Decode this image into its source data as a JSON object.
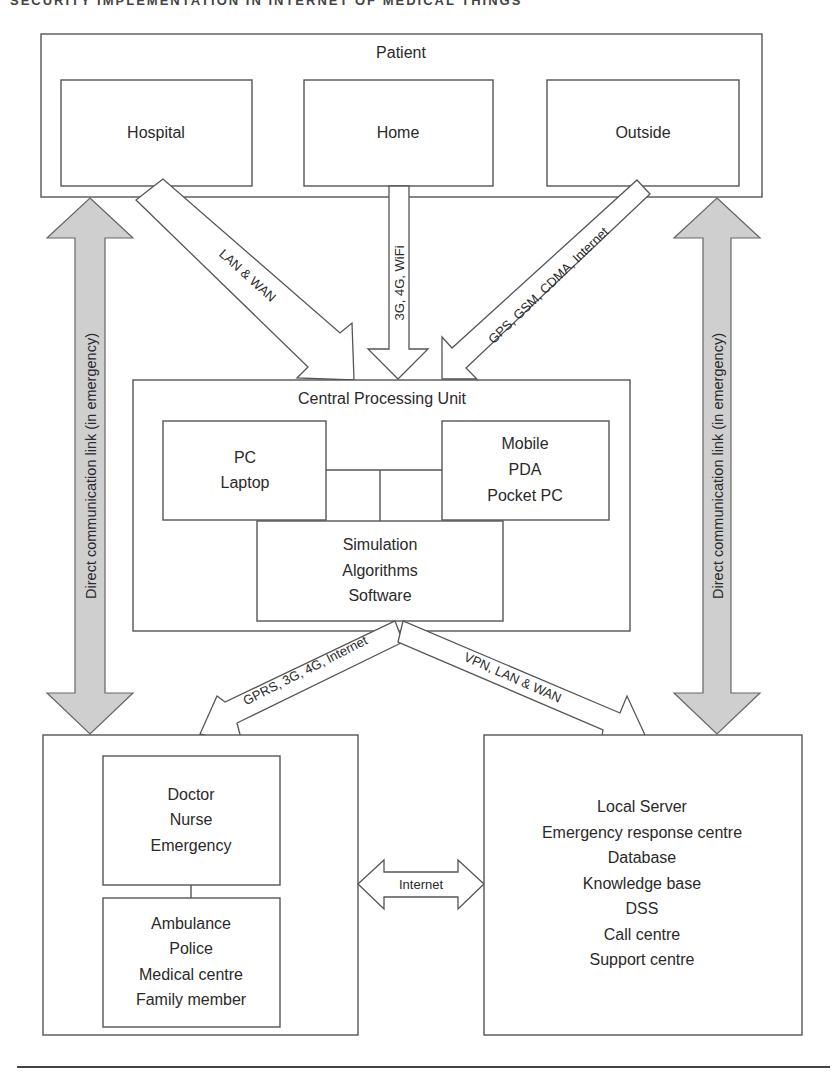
{
  "page": {
    "running_head": "SECURITY IMPLEMENTATION IN INTERNET OF MEDICAL THINGS",
    "caption": ""
  },
  "diagram": {
    "patient": {
      "title": "Patient",
      "locations": [
        "Hospital",
        "Home",
        "Outside"
      ]
    },
    "uplinks": {
      "hospital": "LAN & WAN",
      "home": "3G, 4G, WiFi",
      "outside": "GPS, GSM, CDMA, Internet"
    },
    "cpu": {
      "title": "Central Processing Unit",
      "left_box": [
        "PC",
        "Laptop"
      ],
      "right_box": [
        "Mobile",
        "PDA",
        "Pocket PC"
      ],
      "bottom_box": [
        "Simulation",
        "Algorithms",
        "Software"
      ]
    },
    "downlinks": {
      "left": "GPRS, 3G, 4G, Internet",
      "right": "VPN, LAN & WAN"
    },
    "emergency_link": {
      "left_label": "Direct communication link (in emergency)",
      "right_label": "Direct communication link (in emergency)",
      "color": "#cfcfcf"
    },
    "care_providers": {
      "top_box": [
        "Doctor",
        "Nurse",
        "Emergency"
      ],
      "bottom_box": [
        "Ambulance",
        "Police",
        "Medical centre",
        "Family member"
      ]
    },
    "peer_link": "Internet",
    "services": {
      "items": [
        "Local Server",
        "Emergency response centre",
        "Database",
        "Knowledge base",
        "DSS",
        "Call centre",
        "Support centre"
      ]
    }
  }
}
